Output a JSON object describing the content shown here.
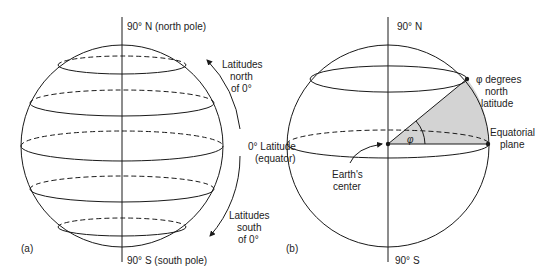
{
  "panel_a": {
    "tag": "(a)",
    "north_pole_label": "90° N (north pole)",
    "south_pole_label": "90° S (south pole)",
    "equator_label_line1": "0° Latitude",
    "equator_label_line2": "(equator)",
    "north_label_line1": "Latitudes",
    "north_label_line2": "north",
    "north_label_line3": "of 0°",
    "south_label_line1": "Latitudes",
    "south_label_line2": "south",
    "south_label_line3": "of 0°"
  },
  "panel_b": {
    "tag": "(b)",
    "north_label": "90° N",
    "south_label": "90° S",
    "phi_symbol": "φ",
    "phi_label_line1": "φ degrees",
    "phi_label_line2": "north",
    "phi_label_line3": "latitude",
    "plane_label_line1": "Equatorial",
    "plane_label_line2": "plane",
    "center_label_line1": "Earth's",
    "center_label_line2": "center"
  },
  "colors": {
    "line": "#1a1a1a",
    "shade": "#d3d3d3",
    "background": "#ffffff"
  }
}
